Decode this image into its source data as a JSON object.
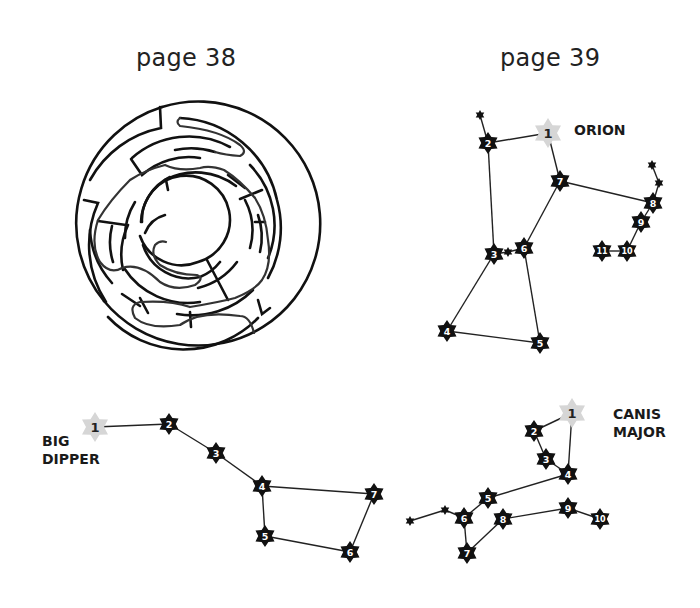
{
  "pages": {
    "left": {
      "title": "page 38"
    },
    "right": {
      "title": "page 39"
    }
  },
  "maze": {
    "name": "circular maze with solution path"
  },
  "colors": {
    "ink": "#111111",
    "first_star": "#d6d6d6",
    "path": "#333333"
  },
  "constellations": {
    "orion": {
      "label": "ORION",
      "stars": [
        {
          "n": "1",
          "x": 548,
          "y": 133,
          "first": true
        },
        {
          "n": "2",
          "x": 488,
          "y": 143
        },
        {
          "n": "3",
          "x": 494,
          "y": 254
        },
        {
          "n": "4",
          "x": 447,
          "y": 331
        },
        {
          "n": "5",
          "x": 540,
          "y": 343
        },
        {
          "n": "6",
          "x": 524,
          "y": 248
        },
        {
          "n": "7",
          "x": 560,
          "y": 181
        },
        {
          "n": "8",
          "x": 653,
          "y": 203
        },
        {
          "n": "9",
          "x": 641,
          "y": 222
        },
        {
          "n": "10",
          "x": 627,
          "y": 251
        },
        {
          "n": "11",
          "x": 602,
          "y": 251
        }
      ],
      "minor": [
        {
          "x": 480,
          "y": 115
        },
        {
          "x": 508,
          "y": 252
        },
        {
          "x": 652,
          "y": 165
        },
        {
          "x": 659,
          "y": 183
        }
      ],
      "lines": [
        [
          [
            480,
            115
          ],
          [
            488,
            143
          ]
        ],
        [
          [
            488,
            143
          ],
          [
            548,
            133
          ]
        ],
        [
          [
            488,
            143
          ],
          [
            494,
            254
          ]
        ],
        [
          [
            548,
            133
          ],
          [
            560,
            181
          ]
        ],
        [
          [
            560,
            181
          ],
          [
            524,
            248
          ]
        ],
        [
          [
            560,
            181
          ],
          [
            653,
            203
          ]
        ],
        [
          [
            494,
            254
          ],
          [
            508,
            252
          ]
        ],
        [
          [
            508,
            252
          ],
          [
            524,
            248
          ]
        ],
        [
          [
            494,
            254
          ],
          [
            447,
            331
          ]
        ],
        [
          [
            447,
            331
          ],
          [
            540,
            343
          ]
        ],
        [
          [
            540,
            343
          ],
          [
            524,
            248
          ]
        ],
        [
          [
            652,
            165
          ],
          [
            659,
            183
          ]
        ],
        [
          [
            659,
            183
          ],
          [
            653,
            203
          ]
        ],
        [
          [
            653,
            203
          ],
          [
            641,
            222
          ]
        ],
        [
          [
            641,
            222
          ],
          [
            627,
            251
          ]
        ],
        [
          [
            627,
            251
          ],
          [
            602,
            251
          ]
        ]
      ]
    },
    "big_dipper": {
      "label_lines": [
        "BIG",
        "DIPPER"
      ],
      "stars": [
        {
          "n": "1",
          "x": 95,
          "y": 427,
          "first": true
        },
        {
          "n": "2",
          "x": 169,
          "y": 424
        },
        {
          "n": "3",
          "x": 216,
          "y": 453
        },
        {
          "n": "4",
          "x": 262,
          "y": 486
        },
        {
          "n": "5",
          "x": 265,
          "y": 536
        },
        {
          "n": "6",
          "x": 350,
          "y": 552
        },
        {
          "n": "7",
          "x": 374,
          "y": 494
        }
      ],
      "minor": [],
      "lines": [
        [
          [
            95,
            427
          ],
          [
            169,
            424
          ]
        ],
        [
          [
            169,
            424
          ],
          [
            216,
            453
          ]
        ],
        [
          [
            216,
            453
          ],
          [
            262,
            486
          ]
        ],
        [
          [
            262,
            486
          ],
          [
            265,
            536
          ]
        ],
        [
          [
            265,
            536
          ],
          [
            350,
            552
          ]
        ],
        [
          [
            350,
            552
          ],
          [
            374,
            494
          ]
        ],
        [
          [
            374,
            494
          ],
          [
            262,
            486
          ]
        ]
      ]
    },
    "canis_major": {
      "label_lines": [
        "CANIS",
        "MAJOR"
      ],
      "stars": [
        {
          "n": "1",
          "x": 572,
          "y": 413,
          "first": true
        },
        {
          "n": "2",
          "x": 534,
          "y": 431
        },
        {
          "n": "3",
          "x": 546,
          "y": 459
        },
        {
          "n": "4",
          "x": 568,
          "y": 474
        },
        {
          "n": "5",
          "x": 488,
          "y": 498
        },
        {
          "n": "6",
          "x": 464,
          "y": 518
        },
        {
          "n": "7",
          "x": 467,
          "y": 553
        },
        {
          "n": "8",
          "x": 503,
          "y": 519
        },
        {
          "n": "9",
          "x": 568,
          "y": 508
        },
        {
          "n": "10",
          "x": 600,
          "y": 519
        }
      ],
      "minor": [
        {
          "x": 410,
          "y": 521
        },
        {
          "x": 445,
          "y": 510
        }
      ],
      "lines": [
        [
          [
            572,
            413
          ],
          [
            534,
            431
          ]
        ],
        [
          [
            534,
            431
          ],
          [
            546,
            459
          ]
        ],
        [
          [
            546,
            459
          ],
          [
            568,
            474
          ]
        ],
        [
          [
            568,
            474
          ],
          [
            572,
            413
          ]
        ],
        [
          [
            568,
            474
          ],
          [
            488,
            498
          ]
        ],
        [
          [
            488,
            498
          ],
          [
            464,
            518
          ]
        ],
        [
          [
            464,
            518
          ],
          [
            445,
            510
          ]
        ],
        [
          [
            445,
            510
          ],
          [
            410,
            521
          ]
        ],
        [
          [
            464,
            518
          ],
          [
            467,
            553
          ]
        ],
        [
          [
            467,
            553
          ],
          [
            503,
            519
          ]
        ],
        [
          [
            503,
            519
          ],
          [
            568,
            508
          ]
        ],
        [
          [
            568,
            508
          ],
          [
            600,
            519
          ]
        ]
      ]
    }
  }
}
